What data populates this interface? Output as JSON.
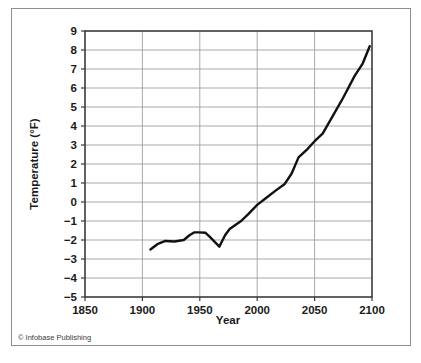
{
  "credit": {
    "symbol": "©",
    "text": "© Infobase Publishing"
  },
  "colors": {
    "line": "#111111",
    "grid": "#9aa0a6",
    "axis": "#3b3b3b",
    "outer_border": "#8c8f91",
    "background": "#ffffff",
    "text": "#1a1a1a"
  },
  "chart_data": {
    "type": "line",
    "title": "",
    "xlabel": "Year",
    "ylabel": "Temperature (°F)",
    "xlim": [
      1850,
      2100
    ],
    "ylim": [
      -5,
      9
    ],
    "xticks": [
      1850,
      1900,
      1950,
      2000,
      2050,
      2100
    ],
    "xtick_labels": [
      "1850",
      "1900",
      "1950",
      "2000",
      "2050",
      "2100"
    ],
    "yticks": [
      -5,
      -4,
      -3,
      -2,
      -1,
      0,
      1,
      2,
      3,
      4,
      5,
      6,
      7,
      8,
      9
    ],
    "ytick_labels": [
      "−5",
      "−4",
      "−3",
      "−2",
      "−1",
      "0",
      "1",
      "2",
      "3",
      "4",
      "5",
      "6",
      "7",
      "8",
      "9"
    ],
    "grid": true,
    "grid_axis": "both",
    "legend": false,
    "legend_position": "none",
    "series": [
      {
        "name": "Temperature anomaly",
        "color": "#111111",
        "linewidth": 2.4,
        "x": [
          1907,
          1913,
          1920,
          1928,
          1936,
          1941,
          1945,
          1949,
          1955,
          1959,
          1963,
          1967,
          1972,
          1976,
          1980,
          1986,
          1992,
          2000,
          2008,
          2016,
          2024,
          2030,
          2036,
          2044,
          2050,
          2057,
          2066,
          2075,
          2085,
          2092,
          2098
        ],
        "y": [
          -2.5,
          -2.22,
          -2.05,
          -2.08,
          -2.0,
          -1.75,
          -1.6,
          -1.6,
          -1.62,
          -1.85,
          -2.1,
          -2.35,
          -1.75,
          -1.42,
          -1.25,
          -1.0,
          -0.65,
          -0.15,
          0.22,
          0.6,
          0.95,
          1.5,
          2.35,
          2.8,
          3.2,
          3.6,
          4.55,
          5.5,
          6.65,
          7.3,
          8.2
        ]
      }
    ]
  }
}
